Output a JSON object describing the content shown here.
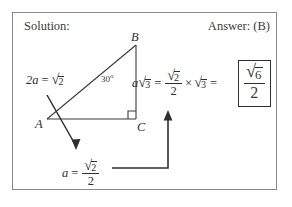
{
  "page": {
    "background_color": "#ffffff",
    "frame_border_color": "#8a8a8a",
    "ink_color": "#2f2f2f"
  },
  "header": {
    "solution_label": "Solution:",
    "answer_label": "Answer: (B)"
  },
  "figure": {
    "type": "right-triangle",
    "vertices": [
      {
        "name": "B",
        "label": "B",
        "x": 136,
        "y": 45
      },
      {
        "name": "A",
        "label": "A",
        "x": 47,
        "y": 119
      },
      {
        "name": "C",
        "label": "C",
        "x": 136,
        "y": 119
      }
    ],
    "angle_at_A": {
      "label": "30",
      "degree_symbol": "o",
      "value_degrees": 30
    },
    "right_angle_at": "C",
    "hypotenuse_label": {
      "lhs": "2a",
      "equals": "=",
      "rhs_radicand": "2",
      "rhs_kind": "square-root"
    }
  },
  "equations": {
    "bottom": {
      "lhs": "a",
      "equals": "=",
      "numerator_radicand": "2",
      "denominator": "2"
    },
    "main": {
      "term1_coefficient": "a",
      "term1_radicand": "3",
      "equals1": "=",
      "fraction_numerator_radicand": "2",
      "fraction_denominator": "2",
      "times": "×",
      "term2_radicand": "3",
      "equals2": "=",
      "result_numerator_radicand": "6",
      "result_denominator": "2"
    }
  },
  "symbols": {
    "radical": "√",
    "times": "×",
    "equals": "=",
    "degree": "o"
  },
  "annotations": {
    "arrow_from_hypotenuse_to_bottom_equation": "down-right arrow",
    "arrow_from_bottom_equation_to_main_expression": "right-then-up elbow arrow"
  }
}
